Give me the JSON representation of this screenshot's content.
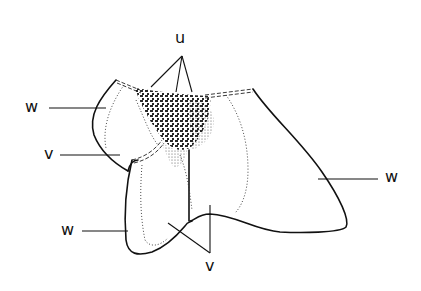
{
  "figure": {
    "type": "anatomical line drawing",
    "labels": [
      {
        "id": "u_top",
        "text": "u",
        "x": 175,
        "y": 32
      },
      {
        "id": "w_upper_left",
        "text": "w",
        "x": 25,
        "y": 98
      },
      {
        "id": "v_left",
        "text": "v",
        "x": 44,
        "y": 146
      },
      {
        "id": "w_lower_left",
        "text": "w",
        "x": 61,
        "y": 222
      },
      {
        "id": "v_bottom",
        "text": "v",
        "x": 208,
        "y": 256
      },
      {
        "id": "w_right",
        "text": "w",
        "x": 385,
        "y": 168
      }
    ],
    "colors": {
      "ink": "#111111",
      "background": "#ffffff"
    }
  }
}
